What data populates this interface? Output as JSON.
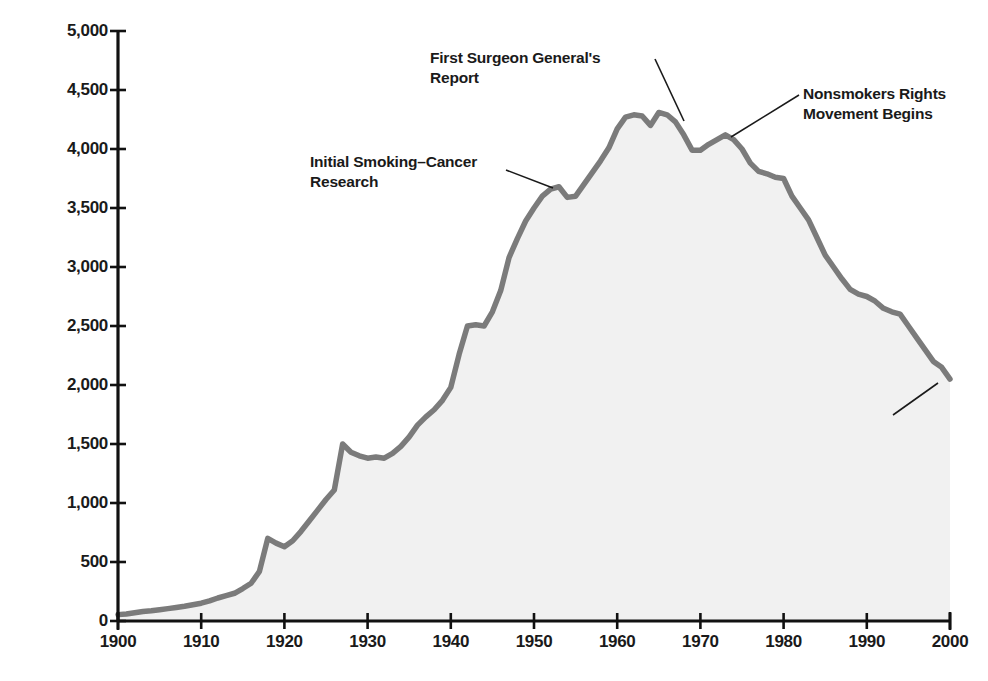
{
  "chart_data": {
    "type": "area",
    "title": "",
    "xlabel": "",
    "ylabel": "Annual Per Capita Cigarette Consumption",
    "xlim": [
      1900,
      2000
    ],
    "ylim": [
      0,
      5000
    ],
    "grid": false,
    "legend": null,
    "line_color": "#7b7b7b",
    "fill_color": "#f1f1f1",
    "axis_color": "#111111",
    "xticks": [
      1900,
      1910,
      1920,
      1930,
      1940,
      1950,
      1960,
      1970,
      1980,
      1990,
      2000
    ],
    "xtick_labels": [
      "1900",
      "1910",
      "1920",
      "1930",
      "1940",
      "1950",
      "1960",
      "1970",
      "1980",
      "1990",
      "2000"
    ],
    "yticks": [
      0,
      500,
      1000,
      1500,
      2000,
      2500,
      3000,
      3500,
      4000,
      4500,
      5000
    ],
    "ytick_labels": [
      "0",
      "500",
      "1,000",
      "1,500",
      "2,000",
      "2,500",
      "3,000",
      "3,500",
      "4,000",
      "4,500",
      "5,000"
    ],
    "x": [
      1900,
      1901,
      1902,
      1903,
      1904,
      1905,
      1906,
      1907,
      1908,
      1909,
      1910,
      1911,
      1912,
      1913,
      1914,
      1915,
      1916,
      1917,
      1918,
      1919,
      1920,
      1921,
      1922,
      1923,
      1924,
      1925,
      1926,
      1927,
      1928,
      1929,
      1930,
      1931,
      1932,
      1933,
      1934,
      1935,
      1936,
      1937,
      1938,
      1939,
      1940,
      1941,
      1942,
      1943,
      1944,
      1945,
      1946,
      1947,
      1948,
      1949,
      1950,
      1951,
      1952,
      1953,
      1954,
      1955,
      1956,
      1957,
      1958,
      1959,
      1960,
      1961,
      1962,
      1963,
      1964,
      1965,
      1966,
      1967,
      1968,
      1969,
      1970,
      1971,
      1972,
      1973,
      1974,
      1975,
      1976,
      1977,
      1978,
      1979,
      1980,
      1981,
      1982,
      1983,
      1984,
      1985,
      1986,
      1987,
      1988,
      1989,
      1990,
      1991,
      1992,
      1993,
      1994,
      1995,
      1996,
      1997,
      1998,
      1999,
      2000
    ],
    "values": [
      54,
      60,
      70,
      80,
      86,
      95,
      105,
      115,
      125,
      138,
      151,
      170,
      195,
      215,
      235,
      275,
      320,
      420,
      700,
      660,
      630,
      680,
      760,
      850,
      940,
      1030,
      1110,
      1500,
      1430,
      1400,
      1380,
      1390,
      1380,
      1420,
      1480,
      1560,
      1660,
      1730,
      1790,
      1870,
      1980,
      2260,
      2500,
      2510,
      2500,
      2620,
      2800,
      3080,
      3240,
      3390,
      3500,
      3600,
      3660,
      3680,
      3590,
      3600,
      3700,
      3800,
      3900,
      4010,
      4170,
      4270,
      4290,
      4280,
      4200,
      4310,
      4290,
      4230,
      4120,
      3990,
      3990,
      4040,
      4080,
      4120,
      4080,
      4000,
      3880,
      3810,
      3790,
      3760,
      3750,
      3600,
      3500,
      3400,
      3250,
      3100,
      3000,
      2900,
      2810,
      2770,
      2750,
      2710,
      2650,
      2620,
      2600,
      2500,
      2400,
      2300,
      2200,
      2150,
      2050
    ],
    "annotations": [
      {
        "id": "initial-smoking-cancer-research",
        "text": "Initial Smoking–Cancer\nResearch",
        "label_x": 310,
        "label_y": 152,
        "leader": [
          [
            506,
            170
          ],
          [
            553,
            188
          ]
        ]
      },
      {
        "id": "first-surgeon-generals-report",
        "text": "First Surgeon General's\nReport",
        "label_x": 430,
        "label_y": 48,
        "leader": [
          [
            684,
            121
          ],
          [
            655,
            59
          ]
        ]
      },
      {
        "id": "nonsmokers-rights-movement-begins",
        "text": "Nonsmokers Rights\nMovement Begins",
        "label_x": 803,
        "label_y": 84,
        "leader": [
          [
            731,
            137
          ],
          [
            799,
            95
          ]
        ]
      },
      {
        "id": "master-antitobacco-settlement",
        "text": "Master Antitobacco\nSettlement",
        "label_x": 748,
        "label_y": 396,
        "leader": [
          [
            938,
            383
          ],
          [
            893,
            415
          ]
        ]
      }
    ]
  }
}
